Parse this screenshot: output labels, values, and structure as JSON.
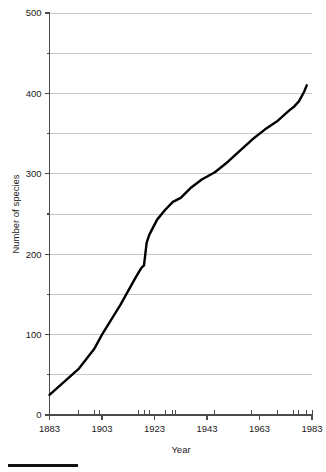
{
  "chart_data": {
    "type": "line",
    "title": "",
    "xlabel": "Year",
    "ylabel": "Number of species",
    "xlim": [
      1883,
      1983
    ],
    "ylim": [
      0,
      500
    ],
    "grid": true,
    "legend": null,
    "y_ticks_major": [
      0,
      100,
      200,
      300,
      400,
      500
    ],
    "y_ticks_minor": [
      50,
      150,
      250,
      350,
      450
    ],
    "y_tick_labels": [
      "0",
      "100",
      "200",
      "300",
      "400",
      "500"
    ],
    "x_ticks_major": [
      1883,
      1903,
      1923,
      1943,
      1963,
      1983
    ],
    "x_tick_labels": [
      "1883",
      "1903",
      "1923",
      "1943",
      "1963",
      "1983"
    ],
    "x_data_ticks": [
      1883,
      1894,
      1900,
      1902,
      1917,
      1919,
      1921,
      1927,
      1930,
      1931,
      1946,
      1960,
      1970,
      1976,
      1978,
      1981,
      1983
    ],
    "series": [
      {
        "name": "Number of species",
        "x": [
          1883,
          1894,
          1900,
          1903,
          1910,
          1916,
          1918,
          1919,
          1920,
          1921,
          1924,
          1927,
          1930,
          1933,
          1937,
          1941,
          1946,
          1951,
          1956,
          1960,
          1965,
          1970,
          1974,
          1976,
          1978,
          1980,
          1981
        ],
        "y": [
          25,
          57,
          82,
          100,
          137,
          172,
          183,
          186,
          214,
          224,
          243,
          255,
          265,
          270,
          283,
          293,
          302,
          315,
          330,
          342,
          355,
          366,
          378,
          383,
          390,
          402,
          410
        ]
      }
    ]
  },
  "footer": {
    "rule_color": "#111111"
  }
}
